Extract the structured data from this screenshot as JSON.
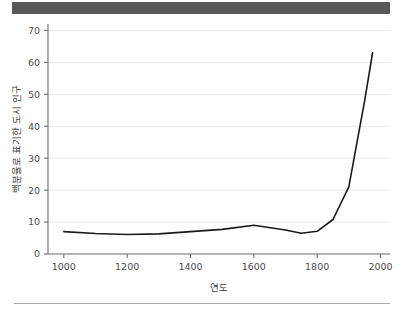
{
  "figure": {
    "top_bar_color": "#585858",
    "bottom_rule_color": "#a8a8a8",
    "background_color": "#ffffff"
  },
  "chart_data": {
    "type": "line",
    "title": "",
    "subtitle": "",
    "xlabel": "연도",
    "ylabel": "백분율로 표기한 도시 인구",
    "xlim": [
      950,
      2030
    ],
    "ylim": [
      0,
      72
    ],
    "xticks": [
      1000,
      1200,
      1400,
      1600,
      1800,
      2000
    ],
    "xtick_labels": [
      "1000",
      "1200",
      "1400",
      "1600",
      "1800",
      "2000"
    ],
    "yticks": [
      0,
      10,
      20,
      30,
      40,
      50,
      60,
      70
    ],
    "ytick_labels": [
      "0",
      "10",
      "20",
      "30",
      "40",
      "50",
      "60",
      "70"
    ],
    "grid": "horizontal",
    "grid_color": "#e9e9e9",
    "line_color": "#1a1a1a",
    "legend": null,
    "legend_position": "none",
    "series": [
      {
        "name": "도시 인구 비율",
        "x": [
          1000,
          1100,
          1200,
          1300,
          1400,
          1500,
          1600,
          1700,
          1750,
          1800,
          1850,
          1900,
          1950,
          1975
        ],
        "values": [
          7.0,
          6.4,
          6.1,
          6.3,
          7.0,
          7.7,
          9.0,
          7.5,
          6.5,
          7.1,
          10.8,
          21.0,
          48.0,
          63.0
        ]
      }
    ]
  }
}
